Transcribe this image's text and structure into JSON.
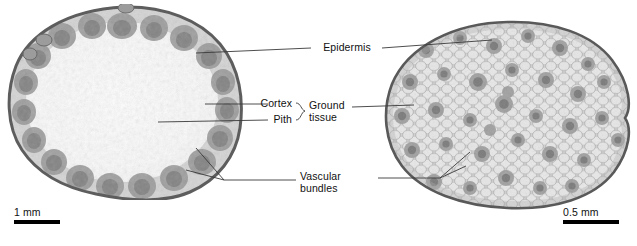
{
  "figure": {
    "background_color": "#ffffff",
    "specimens": [
      {
        "id": "eudicot-stem",
        "common_name": "Eudicot stem cross section",
        "arrangement": "vascular bundles in a ring",
        "scale_bar": {
          "label": "1 mm",
          "bar_width_px": 46
        }
      },
      {
        "id": "monocot-stem",
        "common_name": "Monocot stem cross section",
        "arrangement": "vascular bundles scattered",
        "scale_bar": {
          "label": "0.5 mm",
          "bar_width_px": 56
        }
      }
    ]
  },
  "labels": {
    "epidermis": "Epidermis",
    "cortex": "Cortex",
    "pith": "Pith",
    "ground_tissue_line1": "Ground",
    "ground_tissue_line2": "tissue",
    "vascular_bundles_line1": "Vascular",
    "vascular_bundles_line2": "bundles"
  },
  "scale_bars": {
    "left": "1 mm",
    "right": "0.5 mm"
  },
  "colors": {
    "text": "#111111",
    "leader_line": "#3a3a3a",
    "scale_bar": "#000000",
    "tissue_light": "#e9e9e9",
    "tissue_mid": "#c3c3c3",
    "tissue_dark": "#8f8f8f",
    "epidermis_edge": "#5d5d5d"
  }
}
